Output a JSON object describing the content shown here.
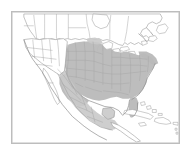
{
  "figure": {
    "type": "range-map",
    "title": "",
    "caption": "",
    "region": "North America",
    "frame": {
      "visible": true,
      "border_color": "#bdbdbd",
      "background_color": "#ffffff",
      "x": 11,
      "y": 11,
      "width": 169,
      "height": 133
    },
    "canvas": {
      "width": 193,
      "height": 157,
      "background_color": "#ffffff"
    }
  },
  "legend": {
    "visible": false,
    "entries": [
      {
        "label": "Range",
        "color": "#b9b9b9"
      },
      {
        "label": "Outside range",
        "color": "#ffffff"
      }
    ]
  },
  "labels": {
    "visible": false,
    "items": []
  },
  "colors": {
    "range_core": "#b9b9b9",
    "range_soft": "#c9c9c9",
    "land_outline": "#9a9a9a",
    "subdivision_line": "#a8a8a8",
    "coast_line": "#8e8e8e",
    "frame": "#bdbdbd",
    "background": "#ffffff"
  },
  "map": {
    "projection_hint": "conic",
    "shaded_area_description": "Contiguous shaded distribution covering the eastern and central United States, the Great Plains, Texas, and most of Mexico",
    "unshaded_area_description": "Western United States, Canada, and the Caribbean shown in white outline only",
    "features": [
      {
        "name": "canada",
        "shaded": false
      },
      {
        "name": "united-states-west",
        "shaded": false
      },
      {
        "name": "united-states-east",
        "shaded": true
      },
      {
        "name": "mexico",
        "shaded": true
      },
      {
        "name": "great-lakes",
        "shaded": false
      },
      {
        "name": "baja-california",
        "shaded": false
      },
      {
        "name": "florida",
        "shaded": true
      },
      {
        "name": "cuba",
        "shaded": false
      },
      {
        "name": "hispaniola",
        "shaded": false
      },
      {
        "name": "bahamas",
        "shaded": false
      },
      {
        "name": "newfoundland",
        "shaded": false
      }
    ]
  }
}
